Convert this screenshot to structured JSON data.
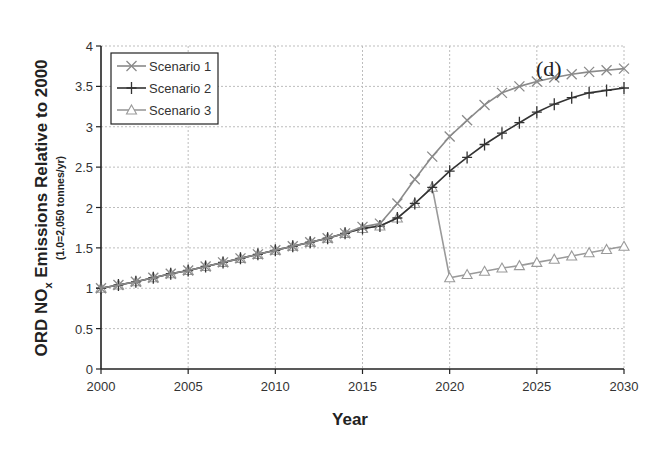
{
  "chart_data": {
    "type": "line",
    "panel_label": "(d)",
    "title": "",
    "xlabel": "Year",
    "ylabel": "ORD NOx Emissions Relative to 2000",
    "ylabel_main": "ORD NO",
    "ylabel_sub": "x",
    "ylabel_rest": " Emissions Relative to 2000",
    "ylabel_note": "(1.0=2,050 tonnes/yr)",
    "xlim": [
      2000,
      2030
    ],
    "ylim": [
      0,
      4
    ],
    "xticks": [
      2000,
      2005,
      2010,
      2015,
      2020,
      2025,
      2030
    ],
    "yticks": [
      0,
      0.5,
      1,
      1.5,
      2,
      2.5,
      3,
      3.5,
      4
    ],
    "ytick_labels": [
      "0",
      "0.5",
      "1",
      "1.5",
      "2",
      "2.5",
      "3",
      "3.5",
      "4"
    ],
    "grid": true,
    "legend_position": "upper-left",
    "series": [
      {
        "name": "Scenario 1",
        "marker": "x",
        "color": "#8a8a8a",
        "x": [
          2000,
          2001,
          2002,
          2003,
          2004,
          2005,
          2006,
          2007,
          2008,
          2009,
          2010,
          2011,
          2012,
          2013,
          2014,
          2015,
          2016,
          2017,
          2018,
          2019,
          2020,
          2021,
          2022,
          2023,
          2024,
          2025,
          2026,
          2027,
          2028,
          2029,
          2030
        ],
        "values": [
          1.0,
          1.04,
          1.08,
          1.13,
          1.18,
          1.22,
          1.27,
          1.32,
          1.37,
          1.42,
          1.47,
          1.52,
          1.57,
          1.62,
          1.68,
          1.76,
          1.8,
          2.05,
          2.35,
          2.63,
          2.88,
          3.08,
          3.27,
          3.42,
          3.5,
          3.56,
          3.61,
          3.65,
          3.68,
          3.7,
          3.72
        ]
      },
      {
        "name": "Scenario 2",
        "marker": "+",
        "color": "#333333",
        "x": [
          2000,
          2001,
          2002,
          2003,
          2004,
          2005,
          2006,
          2007,
          2008,
          2009,
          2010,
          2011,
          2012,
          2013,
          2014,
          2015,
          2016,
          2017,
          2018,
          2019,
          2020,
          2021,
          2022,
          2023,
          2024,
          2025,
          2026,
          2027,
          2028,
          2029,
          2030
        ],
        "values": [
          1.0,
          1.04,
          1.08,
          1.13,
          1.18,
          1.22,
          1.27,
          1.32,
          1.37,
          1.42,
          1.47,
          1.52,
          1.57,
          1.62,
          1.68,
          1.74,
          1.77,
          1.87,
          2.05,
          2.25,
          2.45,
          2.62,
          2.78,
          2.92,
          3.05,
          3.18,
          3.28,
          3.36,
          3.42,
          3.45,
          3.48
        ]
      },
      {
        "name": "Scenario 3",
        "marker": "triangle",
        "color": "#9a9a9a",
        "x": [
          2000,
          2001,
          2002,
          2003,
          2004,
          2005,
          2006,
          2007,
          2008,
          2009,
          2010,
          2011,
          2012,
          2013,
          2014,
          2015,
          2016,
          2017,
          2018,
          2019,
          2020,
          2021,
          2022,
          2023,
          2024,
          2025,
          2026,
          2027,
          2028,
          2029,
          2030
        ],
        "values": [
          1.0,
          1.04,
          1.08,
          1.13,
          1.18,
          1.22,
          1.27,
          1.32,
          1.37,
          1.42,
          1.47,
          1.52,
          1.57,
          1.62,
          1.68,
          1.74,
          1.77,
          1.87,
          2.05,
          2.25,
          1.13,
          1.17,
          1.21,
          1.25,
          1.28,
          1.32,
          1.36,
          1.4,
          1.44,
          1.48,
          1.52
        ]
      }
    ]
  }
}
